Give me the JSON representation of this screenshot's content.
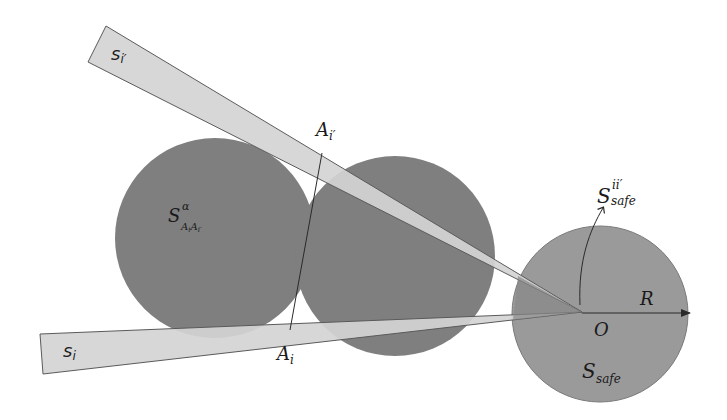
{
  "diagram": {
    "colors": {
      "background": "#ffffff",
      "obstacle_circle": "#7f7f7f",
      "safe_circle": "#9a9a9a",
      "beam_fill": "#d4d4d4",
      "beam_overlap": "#8a8a8a",
      "stroke": "#2a2a2a"
    },
    "labels": {
      "beam_upper": {
        "base": "s",
        "sub": "i′"
      },
      "beam_lower": {
        "base": "s",
        "sub": "i"
      },
      "point_upper": {
        "base": "A",
        "sub": "i′"
      },
      "point_lower": {
        "base": "A",
        "sub": "i"
      },
      "obstacle_region": {
        "base": "S",
        "sup": "α",
        "sub": "A",
        "sub2": "i",
        "sub3": "A",
        "sub4": "i′"
      },
      "safe_sector": {
        "base": "S",
        "sup": "ii′",
        "sub": "safe"
      },
      "origin": "O",
      "radius": "R",
      "safe_region": {
        "base": "S",
        "sub": "safe"
      }
    },
    "geometry": {
      "left_circle": {
        "cx": 215,
        "cy": 238,
        "r": 100
      },
      "right_circle": {
        "cx": 395,
        "cy": 256,
        "r": 100
      },
      "safe_circle": {
        "cx": 600,
        "cy": 314,
        "r": 88
      },
      "origin": {
        "x": 582,
        "y": 312
      },
      "A_i_prime": {
        "x": 322,
        "y": 153
      },
      "A_i": {
        "x": 290,
        "y": 330
      }
    }
  }
}
